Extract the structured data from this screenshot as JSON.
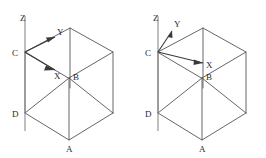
{
  "figure_count": 2,
  "background_color": "#ffffff",
  "line_color": "#555555",
  "axis_color": "#8a8a8a",
  "label_color": "#2b2b2b",
  "figures": [
    {
      "id": "left-figure",
      "caption": "",
      "shape": "cube",
      "vertex_labels": {
        "A": "A",
        "B": "B",
        "C": "C",
        "D": "D"
      },
      "axes": {
        "z": {
          "label": "Z",
          "direction": "up"
        },
        "y": {
          "label": "Y",
          "direction": "up-right-shallow"
        },
        "x": {
          "label": "X",
          "direction": "down-right-shallow"
        }
      },
      "origin_vertex": "C"
    },
    {
      "id": "right-figure",
      "caption": "",
      "shape": "cube",
      "vertex_labels": {
        "A": "A",
        "B": "B",
        "C": "C",
        "D": "D"
      },
      "axes": {
        "z": {
          "label": "Z",
          "direction": "up"
        },
        "y": {
          "label": "Y",
          "direction": "up-right-steep"
        },
        "x": {
          "label": "X",
          "direction": "right-slightly-down"
        }
      },
      "origin_vertex": "C"
    }
  ]
}
